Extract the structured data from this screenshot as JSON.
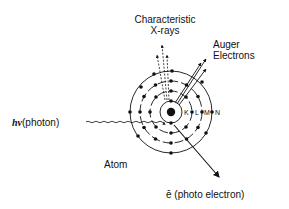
{
  "diagram": {
    "labels": {
      "characteristic_line1": "Characteristic",
      "characteristic_line2": "X-rays",
      "auger_line1": "Auger",
      "auger_line2": "Electrons",
      "photon": "(photon)",
      "photon_symbol": "hν",
      "atom": "Atom",
      "photoelectron": "ē (photo electron)"
    },
    "shells": [
      {
        "name": "K",
        "radius": 11
      },
      {
        "name": "L",
        "radius": 21
      },
      {
        "name": "M",
        "radius": 31
      },
      {
        "name": "N",
        "radius": 41
      }
    ],
    "nucleus": {
      "cx": 171,
      "cy": 112
    },
    "colors": {
      "ink": "#111111",
      "background": "#ffffff"
    }
  }
}
